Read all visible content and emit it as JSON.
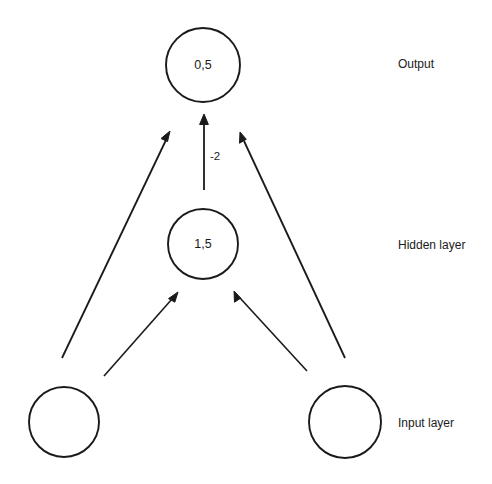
{
  "diagram": {
    "background_color": "#ffffff",
    "stroke_color": "#1a1a1a",
    "nodes": {
      "output": {
        "value": "0,5",
        "label_name": "output-node",
        "cx": 203,
        "cy": 65,
        "r": 37
      },
      "hidden": {
        "value": "1,5",
        "label_name": "hidden-node",
        "cx": 203,
        "cy": 244,
        "r": 35
      },
      "input_left": {
        "value": "",
        "label_name": "input-node-left",
        "cx": 64,
        "cy": 422,
        "r": 35
      },
      "input_right": {
        "value": "",
        "label_name": "input-node-right",
        "cx": 345,
        "cy": 422,
        "r": 36
      }
    },
    "edges": [
      {
        "name": "edge-hidden-to-output",
        "from": "hidden",
        "to": "output",
        "weight": "-2",
        "weight_x": 210,
        "weight_y": 157
      },
      {
        "name": "edge-input-left-to-output",
        "from": "input_left",
        "to": "output",
        "weight": ""
      },
      {
        "name": "edge-input-right-to-output",
        "from": "input_right",
        "to": "output",
        "weight": ""
      },
      {
        "name": "edge-input-left-to-hidden",
        "from": "input_left",
        "to": "hidden",
        "weight": ""
      },
      {
        "name": "edge-input-right-to-hidden",
        "from": "input_right",
        "to": "hidden",
        "weight": ""
      }
    ],
    "layer_labels": {
      "output": "Output",
      "hidden": "Hidden layer",
      "input": "Input layer"
    }
  }
}
